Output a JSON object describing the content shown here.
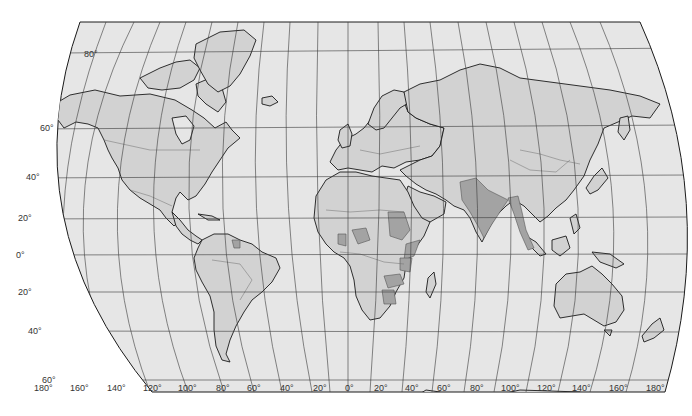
{
  "map": {
    "type": "world-political-outline",
    "colors": {
      "background": "#ffffff",
      "ocean": "#e6e6e6",
      "land": "#d2d2d2",
      "highlighted": "#a3a3a3",
      "coastline": "#1a1a1a",
      "border": "#6e6e6e",
      "grid": "#3a3a3a"
    },
    "latitude_labels": [
      {
        "text": "80°",
        "value": 80
      },
      {
        "text": "60°",
        "value": 60
      },
      {
        "text": "40°",
        "value": 40
      },
      {
        "text": "20°",
        "value": 20
      },
      {
        "text": "0°",
        "value": 0
      },
      {
        "text": "20°",
        "value": -20
      },
      {
        "text": "40°",
        "value": -40
      },
      {
        "text": "60°",
        "value": -60
      }
    ],
    "longitude_labels": [
      {
        "text": "180°",
        "value": -180
      },
      {
        "text": "160°",
        "value": -160
      },
      {
        "text": "140°",
        "value": -140
      },
      {
        "text": "120°",
        "value": -120
      },
      {
        "text": "100°",
        "value": -100
      },
      {
        "text": "80°",
        "value": -80
      },
      {
        "text": "60°",
        "value": -60
      },
      {
        "text": "40°",
        "value": -40
      },
      {
        "text": "20°",
        "value": -20
      },
      {
        "text": "0°",
        "value": 0
      },
      {
        "text": "20°",
        "value": 20
      },
      {
        "text": "40°",
        "value": 40
      },
      {
        "text": "60°",
        "value": 60
      },
      {
        "text": "80°",
        "value": 80
      },
      {
        "text": "100°",
        "value": 100
      },
      {
        "text": "120°",
        "value": 120
      },
      {
        "text": "140°",
        "value": 140
      },
      {
        "text": "160°",
        "value": 160
      },
      {
        "text": "180°",
        "value": 180
      }
    ],
    "highlighted_regions": [
      "Sudan",
      "Nigeria",
      "Ethiopia",
      "Kenya",
      "Tanzania",
      "Uganda",
      "Zambia",
      "Zimbabwe",
      "Botswana",
      "Ghana",
      "Cameroon",
      "Pakistan",
      "India",
      "Nepal",
      "Bangladesh",
      "Myanmar",
      "Malaysia",
      "Guyana",
      "Sri Lanka"
    ]
  }
}
